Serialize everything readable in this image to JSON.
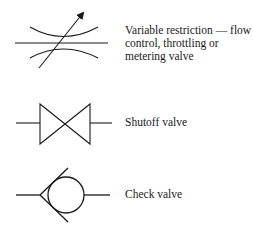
{
  "diagram": {
    "type": "valve-symbol-legend",
    "stroke_color": "#1a1a1a",
    "items": [
      {
        "symbol": "variable-restriction-symbol",
        "label_lines": [
          "Variable restriction — flow",
          "control, throttling or",
          "metering valve"
        ]
      },
      {
        "symbol": "shutoff-valve-symbol",
        "label_lines": [
          "Shutoff valve"
        ]
      },
      {
        "symbol": "check-valve-symbol",
        "label_lines": [
          "Check valve"
        ]
      }
    ]
  }
}
